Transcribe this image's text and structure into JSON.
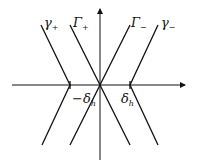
{
  "diagram": {
    "labels": {
      "gamma_plus": "γ",
      "gamma_plus_sub": "+",
      "Gamma_plus": "Γ",
      "Gamma_plus_sub": "+",
      "Gamma_minus": "Γ",
      "Gamma_minus_sub": "−",
      "gamma_minus": "γ",
      "gamma_minus_sub": "−",
      "neg_delta": "−δ",
      "neg_delta_sub": "h",
      "pos_delta": "δ",
      "pos_delta_sub": "h"
    },
    "colors": {
      "line": "#111111",
      "background": "#ffffff"
    }
  }
}
